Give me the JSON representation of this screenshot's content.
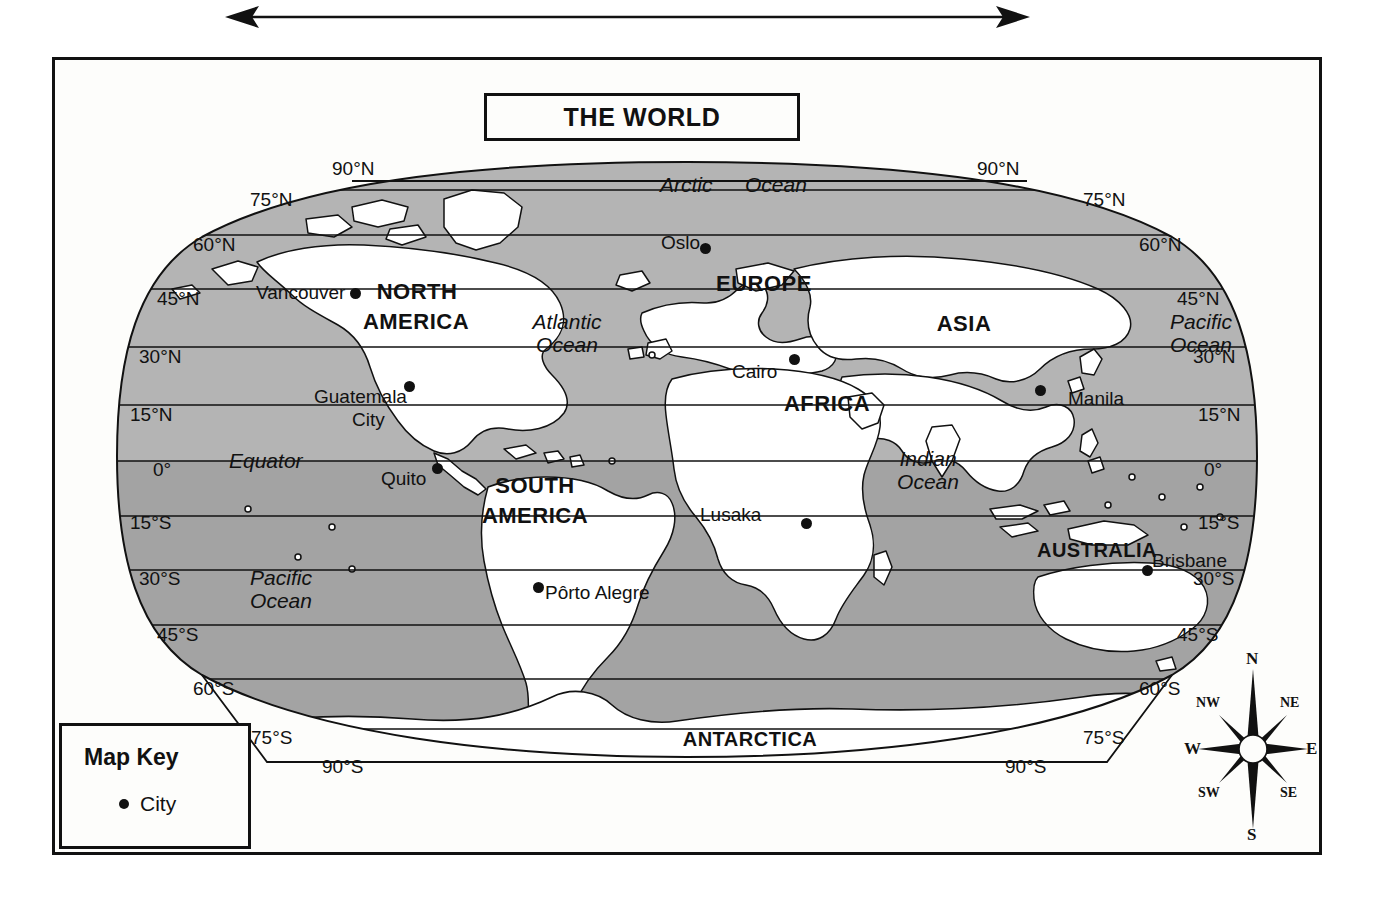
{
  "title": "THE WORLD",
  "top_arrow": {
    "icon": "double-headed-horizontal-arrow"
  },
  "map_key": {
    "title": "Map Key",
    "entries": [
      {
        "symbol": "filled-circle",
        "label": "City"
      }
    ]
  },
  "compass": {
    "directions": {
      "n": "N",
      "ne": "NE",
      "e": "E",
      "se": "SE",
      "s": "S",
      "sw": "SW",
      "w": "W",
      "nw": "NW"
    }
  },
  "graticule": {
    "left": [
      {
        "label": "90°N",
        "x": 332,
        "y": 159
      },
      {
        "label": "75°N",
        "x": 250,
        "y": 190
      },
      {
        "label": "60°N",
        "x": 193,
        "y": 235
      },
      {
        "label": "45°N",
        "x": 157,
        "y": 289
      },
      {
        "label": "30°N",
        "x": 139,
        "y": 347
      },
      {
        "label": "15°N",
        "x": 130,
        "y": 405
      },
      {
        "label": "0°",
        "x": 153,
        "y": 460
      },
      {
        "label": "15°S",
        "x": 130,
        "y": 513
      },
      {
        "label": "30°S",
        "x": 139,
        "y": 569
      },
      {
        "label": "45°S",
        "x": 157,
        "y": 625
      },
      {
        "label": "60°S",
        "x": 193,
        "y": 679
      },
      {
        "label": "75°S",
        "x": 251,
        "y": 728
      },
      {
        "label": "90°S",
        "x": 322,
        "y": 757
      }
    ],
    "right": [
      {
        "label": "90°N",
        "x": 977,
        "y": 159
      },
      {
        "label": "75°N",
        "x": 1083,
        "y": 190
      },
      {
        "label": "60°N",
        "x": 1139,
        "y": 235
      },
      {
        "label": "45°N",
        "x": 1177,
        "y": 289
      },
      {
        "label": "30°N",
        "x": 1193,
        "y": 347
      },
      {
        "label": "15°N",
        "x": 1198,
        "y": 405
      },
      {
        "label": "0°",
        "x": 1204,
        "y": 460
      },
      {
        "label": "15°S",
        "x": 1198,
        "y": 513
      },
      {
        "label": "30°S",
        "x": 1193,
        "y": 569
      },
      {
        "label": "45°S",
        "x": 1177,
        "y": 625
      },
      {
        "label": "60°S",
        "x": 1139,
        "y": 679
      },
      {
        "label": "75°S",
        "x": 1083,
        "y": 728
      },
      {
        "label": "90°S",
        "x": 1005,
        "y": 757
      }
    ]
  },
  "continents": [
    {
      "name": "NORTH",
      "x": 352,
      "y": 280,
      "w": 130
    },
    {
      "name": "AMERICA",
      "x": 336,
      "y": 310,
      "w": 160
    },
    {
      "name": "SOUTH",
      "x": 470,
      "y": 474,
      "w": 130
    },
    {
      "name": "AMERICA",
      "x": 452,
      "y": 504,
      "w": 166
    },
    {
      "name": "EUROPE",
      "x": 705,
      "y": 272,
      "w": 118
    },
    {
      "name": "AFRICA",
      "x": 772,
      "y": 392,
      "w": 110
    },
    {
      "name": "ASIA",
      "x": 925,
      "y": 312,
      "w": 78
    },
    {
      "name": "AUSTRALIA",
      "x": 1032,
      "y": 540,
      "w": 130
    },
    {
      "name": "ANTARCTICA",
      "x": 670,
      "y": 729,
      "w": 160
    }
  ],
  "oceans": [
    {
      "name": "Arctic",
      "x": 660,
      "y": 174
    },
    {
      "name": "Ocean",
      "x": 745,
      "y": 174
    },
    {
      "name": "Atlantic",
      "x": 512,
      "y": 311,
      "w": 110
    },
    {
      "name": "Ocean",
      "x": 512,
      "y": 334,
      "w": 110
    },
    {
      "name": "Pacific",
      "x": 1158,
      "y": 311,
      "w": 86
    },
    {
      "name": "Ocean",
      "x": 1158,
      "y": 334,
      "w": 86
    },
    {
      "name": "Indian",
      "x": 884,
      "y": 448,
      "w": 88
    },
    {
      "name": "Ocean",
      "x": 884,
      "y": 471,
      "w": 88
    },
    {
      "name": "Pacific",
      "x": 235,
      "y": 567,
      "w": 92
    },
    {
      "name": "Ocean",
      "x": 235,
      "y": 590,
      "w": 92
    }
  ],
  "equator_label": {
    "name": "Equator",
    "x": 229,
    "y": 450
  },
  "cities": [
    {
      "name": "Vancouver",
      "dot_x": 350,
      "dot_y": 288,
      "label_x": 256,
      "label_y": 283,
      "anchor": "right"
    },
    {
      "name": "Guatemala",
      "dot_x": 404,
      "dot_y": 381,
      "label_x": 314,
      "label_y": 387,
      "anchor": "left"
    },
    {
      "name": "City",
      "dot_x": null,
      "dot_y": null,
      "label_x": 352,
      "label_y": 410,
      "anchor": "left"
    },
    {
      "name": "Quito",
      "dot_x": 432,
      "dot_y": 463,
      "label_x": 381,
      "label_y": 469,
      "anchor": "right"
    },
    {
      "name": "Pôrto Alegre",
      "dot_x": 533,
      "dot_y": 582,
      "label_x": 545,
      "label_y": 583,
      "anchor": "left"
    },
    {
      "name": "Oslo",
      "dot_x": 700,
      "dot_y": 243,
      "label_x": 661,
      "label_y": 233,
      "anchor": "right"
    },
    {
      "name": "Cairo",
      "dot_x": 789,
      "dot_y": 354,
      "label_x": 732,
      "label_y": 362,
      "anchor": "left"
    },
    {
      "name": "Lusaka",
      "dot_x": 801,
      "dot_y": 518,
      "label_x": 700,
      "label_y": 505,
      "anchor": "left"
    },
    {
      "name": "Manila",
      "dot_x": 1035,
      "dot_y": 385,
      "label_x": 1068,
      "label_y": 389,
      "anchor": "left"
    },
    {
      "name": "Brisbane",
      "dot_x": 1142,
      "dot_y": 565,
      "label_x": 1152,
      "label_y": 551,
      "anchor": "left"
    }
  ],
  "colors": {
    "ink": "#111111",
    "paper": "#fdfdfb",
    "ocean_north": "#b4b4b4",
    "ocean_south": "#a0a0a0",
    "land": "#ffffff"
  }
}
